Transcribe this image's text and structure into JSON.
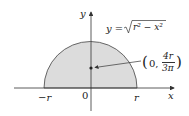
{
  "diagram": {
    "type": "semicircle-centroid",
    "axes": {
      "x_label": "x",
      "y_label": "y",
      "origin_label": "0",
      "left_tick_label": "−r",
      "right_tick_label": "r"
    },
    "curve_label": {
      "lhs": "y =",
      "radicand": "r² − x²"
    },
    "centroid_label": {
      "open": "(",
      "x": "0,",
      "numerator": "4r",
      "denominator": "3π",
      "close": ")"
    },
    "colors": {
      "fill": "#dcdcdc",
      "stroke": "#333333",
      "text": "#222222"
    }
  }
}
